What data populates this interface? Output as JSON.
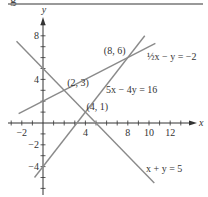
{
  "header": {
    "fragment": "g"
  },
  "chart_data": {
    "type": "line",
    "title": "",
    "xlabel": "x",
    "ylabel": "y",
    "xlim": [
      -3,
      14
    ],
    "ylim": [
      -6.5,
      9.5
    ],
    "grid": false,
    "x_ticks": [
      -2,
      4,
      8,
      10,
      12
    ],
    "y_ticks": [
      8,
      4,
      -2,
      -4
    ],
    "series": [
      {
        "name": "x + y = 5",
        "equation": "x + y = 5",
        "points": [
          [
            -2.5,
            7.5
          ],
          [
            10.5,
            -5.5
          ]
        ]
      },
      {
        "name": "5x - 4y = 16",
        "equation": "5x − 4y = 16",
        "points": [
          [
            -0.8,
            -5
          ],
          [
            9.6,
            8
          ]
        ]
      },
      {
        "name": "1/2 x - y = -2",
        "equation": "½x − y = −2",
        "points": [
          [
            -2.3,
            0.85
          ],
          [
            10.6,
            7.3
          ]
        ]
      }
    ],
    "annotations": [
      {
        "text": "(2, 3)",
        "x": 2,
        "y": 3
      },
      {
        "text": "(8, 6)",
        "x": 8,
        "y": 6
      },
      {
        "text": "(4, 1)",
        "x": 4,
        "y": 1
      }
    ],
    "line_labels": [
      {
        "text": "½x − y = −2"
      },
      {
        "text": "5x − 4y = 16"
      },
      {
        "text": "x + y = 5"
      }
    ],
    "colors": {
      "lines": "#8a8a8a",
      "axes": "#333333",
      "rule": "#777777"
    }
  }
}
